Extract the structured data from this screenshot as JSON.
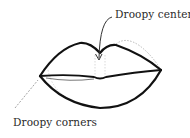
{
  "figure": {
    "labels": {
      "center": "Droopy center",
      "corners": "Droopy corners"
    },
    "colors": {
      "outline": "#111111",
      "guide": "#b8b8b8",
      "text": "#2a2a2a"
    }
  }
}
